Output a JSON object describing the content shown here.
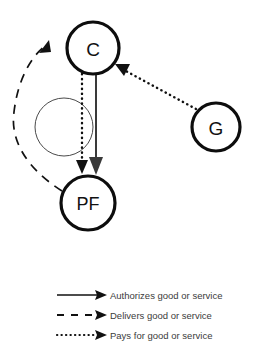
{
  "diagram": {
    "nodes": [
      {
        "id": "C",
        "label": "C",
        "cx": 93,
        "cy": 48,
        "r": 26
      },
      {
        "id": "PF",
        "label": "PF",
        "cx": 88,
        "cy": 203,
        "r": 27
      },
      {
        "id": "G",
        "label": "G",
        "cx": 216,
        "cy": 127,
        "r": 24
      }
    ],
    "edges": [
      {
        "id": "c-to-pf-authorizes",
        "from": "C",
        "to": "PF",
        "style": "solid",
        "meaning": "Authorizes good or service"
      },
      {
        "id": "c-to-pf-pays",
        "from": "C",
        "to": "PF",
        "style": "dotted",
        "meaning": "Pays for good or service"
      },
      {
        "id": "pf-to-c-delivers",
        "from": "PF",
        "to": "C",
        "style": "dashed",
        "meaning": "Delivers good or service"
      },
      {
        "id": "g-to-c-pays",
        "from": "G",
        "to": "C",
        "style": "dotted",
        "meaning": "Pays for good or service"
      }
    ]
  },
  "legend": {
    "items": [
      {
        "style": "solid",
        "label": "Authorizes good or service"
      },
      {
        "style": "dashed",
        "label": "Delivers good or service"
      },
      {
        "style": "dotted",
        "label": "Pays for good or service"
      }
    ]
  },
  "colors": {
    "background": "#ffffff",
    "stroke": "#111111",
    "stroke_gray": "#3a3a3a",
    "thin_circle": "#4a4a4a",
    "legend_text": "#3b3b3b"
  }
}
